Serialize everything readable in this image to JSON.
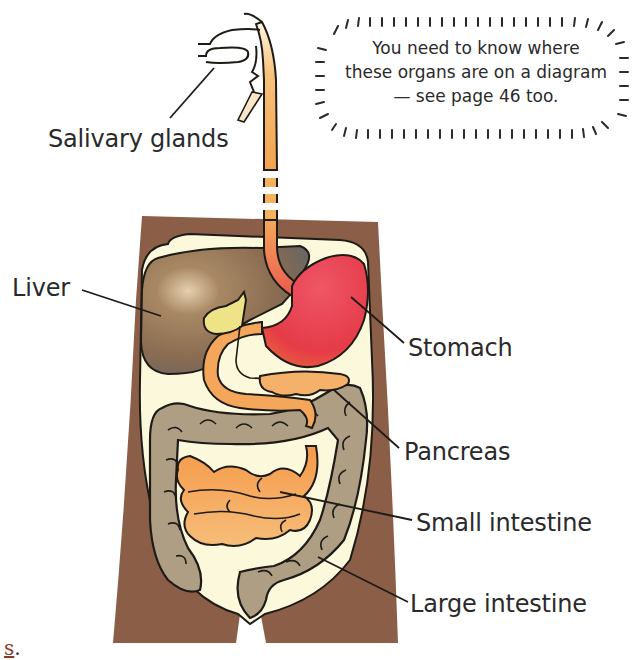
{
  "diagram": {
    "labels": {
      "salivary_glands": "Salivary glands",
      "liver": "Liver",
      "stomach": "Stomach",
      "pancreas": "Pancreas",
      "small_intestine": "Small intestine",
      "large_intestine": "Large intestine"
    },
    "note": {
      "line1": "You need to know where",
      "line2": "these organs are on a diagram",
      "line3": "— see page 46 too."
    },
    "page_fragment": {
      "text": "s",
      "punct": "."
    },
    "colors": {
      "body": "#8b5e48",
      "cavity": "#fbf8dc",
      "liver": "#8a6e52",
      "liver_shadow": "#6f6860",
      "stomach": "#e9434f",
      "gut_orange": "#f4a75a",
      "gall_bladder": "#eee487",
      "large_intestine": "#ad9e84",
      "outline": "#1e1a16"
    }
  }
}
